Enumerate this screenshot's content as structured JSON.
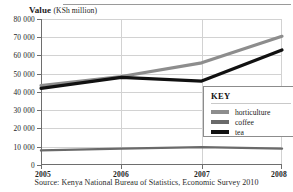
{
  "figure": {
    "axis_title_strong": "Value",
    "axis_title_paren": "(KSh million)",
    "source": "Source: Kenya National Bureau of Statistics, Economic Survey 2010"
  },
  "legend": {
    "title": "KEY",
    "entries": [
      {
        "label": "horticulture",
        "color": "#8d8d8d"
      },
      {
        "label": "coffee",
        "color": "#6a6a6a"
      },
      {
        "label": "tea",
        "color": "#111111"
      }
    ]
  },
  "chart_data": {
    "type": "line",
    "title": "Value (KSh million)",
    "xlabel": "",
    "ylabel": "Value (KSh million)",
    "x": [
      2005,
      2006,
      2007,
      2008
    ],
    "categories": [
      "2005",
      "2006",
      "2007",
      "2008"
    ],
    "xticklabels": [
      "2005",
      "2006",
      "2007",
      "2008"
    ],
    "yticklabels": [
      "0",
      "10 000",
      "20 000",
      "30 000",
      "40 000",
      "50 000",
      "60 000",
      "70 000",
      "80 000"
    ],
    "yticks": [
      0,
      10000,
      20000,
      30000,
      40000,
      50000,
      60000,
      70000,
      80000
    ],
    "ylim": [
      0,
      80000
    ],
    "xlim": [
      2005,
      2008
    ],
    "grid": true,
    "legend_position": "inside-lower-right",
    "series": [
      {
        "name": "horticulture",
        "color": "#8d8d8d",
        "values": [
          43500,
          48500,
          56000,
          70500
        ]
      },
      {
        "name": "coffee",
        "color": "#6a6a6a",
        "values": [
          8000,
          9000,
          9800,
          9000
        ]
      },
      {
        "name": "tea",
        "color": "#111111",
        "values": [
          42000,
          48000,
          46000,
          63000
        ]
      }
    ]
  }
}
